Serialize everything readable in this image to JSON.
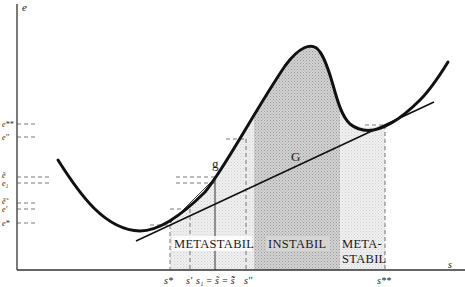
{
  "diagram": {
    "axes": {
      "y_label": "e",
      "x_label": "s"
    },
    "y_ticks": [
      {
        "label": "e**",
        "y": 124
      },
      {
        "label": "e''",
        "y": 137
      },
      {
        "label": "ẽ",
        "y": 177
      },
      {
        "label": "e₁",
        "y": 183
      },
      {
        "label": "ẽ̃",
        "y": 203
      },
      {
        "label": "e'",
        "y": 209
      },
      {
        "label": "e*",
        "y": 223
      }
    ],
    "x_ticks": [
      {
        "label": "s*",
        "x": 170
      },
      {
        "label": "s'",
        "x": 190
      },
      {
        "label": "s₁ = s̃ = s̃̃",
        "x": 215
      },
      {
        "label": "s''",
        "x": 246
      },
      {
        "label": "s**",
        "x": 385
      }
    ],
    "curve_labels": {
      "g": "g",
      "G": "G"
    },
    "regions": [
      {
        "label": "METASTABIL",
        "x_from": 170,
        "x_to": 254
      },
      {
        "label": "INSTABIL",
        "x_from": 254,
        "x_to": 340
      },
      {
        "label": "META-",
        "label2": "STABIL",
        "x_from": 340,
        "x_to": 385
      }
    ],
    "colors": {
      "curve": "#111111",
      "axis": "#222222",
      "instabil_fill": "#c9c9c9",
      "metastabil_fill": "#ececec"
    }
  }
}
